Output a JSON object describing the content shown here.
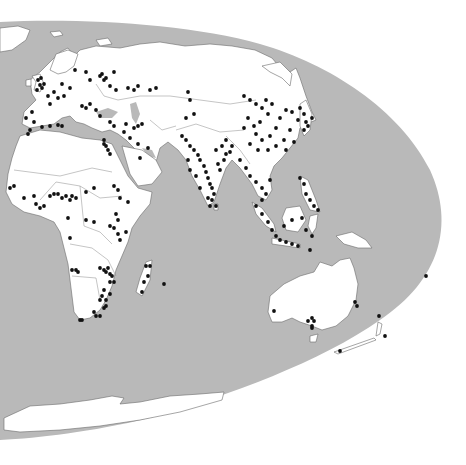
{
  "map": {
    "projection": "elliptical world map (Eastern Hemisphere focus)",
    "colors": {
      "background": "#ffffff",
      "ocean": "#b9b9b9",
      "land": "#ffffff",
      "border": "#7a7a7a",
      "dot": "#111111"
    },
    "regions_shown": [
      "Europe",
      "Africa",
      "Middle East",
      "South Asia",
      "East Asia",
      "Southeast Asia",
      "Australia",
      "New Zealand",
      "Antarctica",
      "Madagascar"
    ],
    "dot_clusters": [
      {
        "region": "British Isles",
        "points": [
          [
            38,
            80
          ],
          [
            40,
            85
          ],
          [
            42,
            88
          ],
          [
            37,
            90
          ],
          [
            44,
            84
          ],
          [
            41,
            78
          ]
        ]
      },
      {
        "region": "Western Europe",
        "points": [
          [
            48,
            96
          ],
          [
            54,
            92
          ],
          [
            62,
            84
          ],
          [
            58,
            98
          ],
          [
            50,
            104
          ],
          [
            64,
            96
          ],
          [
            70,
            88
          ]
        ]
      },
      {
        "region": "Iberia & North Africa coast",
        "points": [
          [
            26,
            118
          ],
          [
            32,
            112
          ],
          [
            34,
            122
          ],
          [
            28,
            134
          ],
          [
            30,
            130
          ],
          [
            42,
            127
          ],
          [
            50,
            126
          ],
          [
            58,
            125
          ],
          [
            62,
            126
          ]
        ]
      },
      {
        "region": "Eastern Europe & Russia",
        "points": [
          [
            75,
            70
          ],
          [
            86,
            72
          ],
          [
            90,
            80
          ],
          [
            100,
            76
          ],
          [
            104,
            80
          ],
          [
            110,
            86
          ],
          [
            116,
            90
          ],
          [
            128,
            88
          ],
          [
            134,
            90
          ],
          [
            138,
            86
          ],
          [
            102,
            74
          ],
          [
            106,
            78
          ],
          [
            114,
            72
          ]
        ]
      },
      {
        "region": "Balkans & Turkey",
        "points": [
          [
            82,
            106
          ],
          [
            86,
            108
          ],
          [
            90,
            104
          ],
          [
            96,
            110
          ],
          [
            100,
            116
          ],
          [
            110,
            122
          ],
          [
            114,
            126
          ],
          [
            126,
            124
          ],
          [
            134,
            128
          ],
          [
            138,
            126
          ],
          [
            142,
            124
          ]
        ]
      },
      {
        "region": "Nile / Egypt",
        "points": [
          [
            104,
            140
          ],
          [
            106,
            146
          ],
          [
            108,
            150
          ],
          [
            110,
            154
          ],
          [
            104,
            144
          ]
        ]
      },
      {
        "region": "Arabia",
        "points": [
          [
            124,
            132
          ],
          [
            130,
            138
          ],
          [
            138,
            144
          ],
          [
            140,
            158
          ],
          [
            148,
            148
          ]
        ]
      },
      {
        "region": "Central Asia",
        "points": [
          [
            150,
            90
          ],
          [
            156,
            88
          ],
          [
            188,
            92
          ],
          [
            190,
            100
          ],
          [
            186,
            118
          ],
          [
            194,
            114
          ]
        ]
      },
      {
        "region": "India",
        "points": [
          [
            182,
            136
          ],
          [
            186,
            140
          ],
          [
            190,
            146
          ],
          [
            194,
            150
          ],
          [
            198,
            155
          ],
          [
            200,
            160
          ],
          [
            204,
            166
          ],
          [
            206,
            172
          ],
          [
            208,
            178
          ],
          [
            210,
            184
          ],
          [
            212,
            188
          ],
          [
            214,
            194
          ],
          [
            212,
            200
          ],
          [
            210,
            206
          ],
          [
            208,
            198
          ],
          [
            200,
            188
          ],
          [
            196,
            176
          ],
          [
            190,
            170
          ],
          [
            188,
            160
          ],
          [
            216,
            150
          ],
          [
            222,
            146
          ],
          [
            226,
            154
          ],
          [
            230,
            152
          ],
          [
            220,
            170
          ],
          [
            218,
            164
          ],
          [
            226,
            140
          ],
          [
            232,
            146
          ],
          [
            224,
            160
          ],
          [
            216,
            206
          ]
        ]
      },
      {
        "region": "China",
        "points": [
          [
            244,
            96
          ],
          [
            250,
            100
          ],
          [
            256,
            104
          ],
          [
            262,
            108
          ],
          [
            266,
            100
          ],
          [
            272,
            104
          ],
          [
            268,
            114
          ],
          [
            260,
            122
          ],
          [
            254,
            126
          ],
          [
            248,
            118
          ],
          [
            256,
            134
          ],
          [
            262,
            140
          ],
          [
            270,
            136
          ],
          [
            276,
            128
          ],
          [
            280,
            118
          ],
          [
            286,
            110
          ],
          [
            292,
            112
          ],
          [
            298,
            120
          ],
          [
            290,
            130
          ],
          [
            284,
            140
          ],
          [
            276,
            146
          ],
          [
            268,
            150
          ],
          [
            258,
            150
          ],
          [
            250,
            144
          ],
          [
            244,
            128
          ],
          [
            286,
            150
          ],
          [
            294,
            142
          ]
        ]
      },
      {
        "region": "Korea & Japan",
        "points": [
          [
            300,
            108
          ],
          [
            304,
            114
          ],
          [
            306,
            122
          ],
          [
            304,
            130
          ],
          [
            308,
            126
          ],
          [
            312,
            118
          ]
        ]
      },
      {
        "region": "Southeast Asia mainland",
        "points": [
          [
            240,
            160
          ],
          [
            246,
            168
          ],
          [
            250,
            176
          ],
          [
            256,
            182
          ],
          [
            262,
            188
          ],
          [
            266,
            194
          ],
          [
            262,
            200
          ],
          [
            270,
            180
          ]
        ]
      },
      {
        "region": "Philippines",
        "points": [
          [
            300,
            178
          ],
          [
            304,
            184
          ],
          [
            306,
            194
          ],
          [
            310,
            200
          ],
          [
            314,
            206
          ],
          [
            318,
            210
          ]
        ]
      },
      {
        "region": "Indonesia & Malaysia",
        "points": [
          [
            256,
            206
          ],
          [
            262,
            214
          ],
          [
            268,
            222
          ],
          [
            272,
            230
          ],
          [
            276,
            236
          ],
          [
            280,
            240
          ],
          [
            286,
            242
          ],
          [
            292,
            244
          ],
          [
            298,
            246
          ],
          [
            284,
            226
          ],
          [
            292,
            220
          ],
          [
            302,
            218
          ],
          [
            306,
            230
          ],
          [
            312,
            236
          ],
          [
            310,
            250
          ]
        ]
      },
      {
        "region": "West Africa",
        "points": [
          [
            10,
            188
          ],
          [
            14,
            186
          ],
          [
            24,
            198
          ],
          [
            34,
            196
          ],
          [
            36,
            204
          ],
          [
            40,
            208
          ],
          [
            44,
            206
          ],
          [
            50,
            196
          ],
          [
            54,
            194
          ],
          [
            58,
            194
          ],
          [
            62,
            198
          ],
          [
            66,
            196
          ],
          [
            70,
            200
          ],
          [
            72,
            196
          ],
          [
            76,
            198
          ]
        ]
      },
      {
        "region": "East Africa",
        "points": [
          [
            86,
            192
          ],
          [
            94,
            188
          ],
          [
            114,
            186
          ],
          [
            118,
            190
          ],
          [
            120,
            198
          ],
          [
            116,
            214
          ],
          [
            118,
            220
          ],
          [
            114,
            228
          ],
          [
            118,
            234
          ],
          [
            120,
            240
          ],
          [
            126,
            232
          ],
          [
            128,
            202
          ],
          [
            110,
            226
          ]
        ]
      },
      {
        "region": "Central Africa",
        "points": [
          [
            68,
            218
          ],
          [
            86,
            220
          ],
          [
            94,
            222
          ],
          [
            70,
            238
          ]
        ]
      },
      {
        "region": "Southern Africa",
        "points": [
          [
            72,
            270
          ],
          [
            76,
            270
          ],
          [
            78,
            272
          ],
          [
            100,
            268
          ],
          [
            104,
            270
          ],
          [
            106,
            272
          ],
          [
            108,
            268
          ],
          [
            110,
            274
          ],
          [
            112,
            276
          ],
          [
            110,
            282
          ],
          [
            114,
            282
          ],
          [
            104,
            290
          ],
          [
            102,
            296
          ],
          [
            110,
            294
          ],
          [
            106,
            300
          ],
          [
            100,
            300
          ],
          [
            94,
            312
          ],
          [
            96,
            316
          ],
          [
            100,
            316
          ],
          [
            104,
            308
          ],
          [
            106,
            306
          ],
          [
            80,
            320
          ],
          [
            82,
            320
          ]
        ]
      },
      {
        "region": "Madagascar & islands",
        "points": [
          [
            146,
            266
          ],
          [
            150,
            266
          ],
          [
            148,
            276
          ],
          [
            144,
            282
          ],
          [
            142,
            292
          ],
          [
            164,
            284
          ]
        ]
      },
      {
        "region": "Australia",
        "points": [
          [
            274,
            311
          ],
          [
            308,
            321
          ],
          [
            312,
            318
          ],
          [
            314,
            321
          ],
          [
            355,
            302
          ],
          [
            357,
            306
          ],
          [
            312,
            328
          ],
          [
            312,
            326
          ]
        ]
      },
      {
        "region": "New Zealand",
        "points": [
          [
            379,
            316
          ],
          [
            385,
            336
          ],
          [
            340,
            351
          ],
          [
            426,
            276
          ]
        ]
      }
    ]
  }
}
